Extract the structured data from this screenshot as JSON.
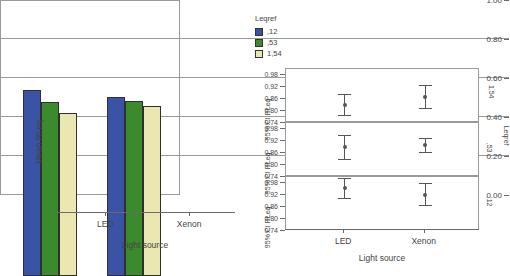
{
  "chart_data": [
    {
      "type": "bar",
      "title": "",
      "xlabel": "Light source",
      "ylabel": "Mean RLeq",
      "categories": [
        "LED",
        "Xenon"
      ],
      "ylim": [
        0.0,
        1.0
      ],
      "yticks": [
        "0.00",
        "0.20",
        "0.40",
        "0.60",
        "0.80",
        "1.00"
      ],
      "ytick_values": [
        0.0,
        0.2,
        0.4,
        0.6,
        0.8,
        1.0
      ],
      "grid": true,
      "legend_position": "right",
      "legend_title": "Leqref",
      "series": [
        {
          "name": ",12",
          "color": "#3A53A4",
          "values": [
            0.955,
            0.92
          ]
        },
        {
          "name": ",53",
          "color": "#3C8A2E",
          "values": [
            0.89,
            0.9
          ]
        },
        {
          "name": "1,54",
          "color": "#EAE8B0",
          "values": [
            0.835,
            0.87
          ]
        }
      ]
    },
    {
      "type": "scatter",
      "subtype": "error-bar-panels",
      "xlabel": "Light source",
      "ylabel": "95% CI RLeq",
      "categories": [
        "LED",
        "Xenon"
      ],
      "ylim": [
        0.74,
        1.01
      ],
      "yticks": [
        "0.74",
        "0.80",
        "0.86",
        "0.92",
        "0.98"
      ],
      "ytick_values": [
        0.74,
        0.8,
        0.86,
        0.92,
        0.98
      ],
      "grid": false,
      "strip_title": "Leqref",
      "panels": [
        {
          "strip_label": "1,54",
          "points": [
            {
              "x": "LED",
              "mean": 0.832,
              "lower": 0.782,
              "upper": 0.887
            },
            {
              "x": "Xenon",
              "mean": 0.872,
              "lower": 0.815,
              "upper": 0.928
            }
          ]
        },
        {
          "strip_label": ",53",
          "points": [
            {
              "x": "LED",
              "mean": 0.89,
              "lower": 0.83,
              "upper": 0.95
            },
            {
              "x": "Xenon",
              "mean": 0.902,
              "lower": 0.866,
              "upper": 0.936
            }
          ]
        },
        {
          "strip_label": ",12",
          "points": [
            {
              "x": "LED",
              "mean": 0.955,
              "lower": 0.906,
              "upper": 1.005
            },
            {
              "x": "Xenon",
              "mean": 0.921,
              "lower": 0.869,
              "upper": 0.978
            }
          ]
        }
      ]
    }
  ],
  "bar_chart": {
    "ylabel": "Mean RLeq",
    "xlabel": "Light source",
    "yticks": [
      "1.00",
      "0.80",
      "0.60",
      "0.40",
      "0.20",
      "0.00"
    ],
    "xticks": [
      "LED",
      "Xenon"
    ]
  },
  "legend": {
    "title": "Leqref",
    "items": [
      {
        "label": ",12",
        "color": "#3A53A4"
      },
      {
        "label": ",53",
        "color": "#3C8A2E"
      },
      {
        "label": "1,54",
        "color": "#EAE8B0"
      }
    ]
  },
  "ci_chart": {
    "xlabel": "Light source",
    "xticks": [
      "LED",
      "Xenon"
    ],
    "strip_title": "Leqref",
    "panels": [
      {
        "ylabel": "95% CI RLeq",
        "strip_label": "1,54",
        "yticks": [
          "0.98",
          "0.92",
          "0.86",
          "0.80",
          "0.74"
        ]
      },
      {
        "ylabel": "95% CI RLeq",
        "strip_label": ",53",
        "yticks": [
          "0.98",
          "0.92",
          "0.86",
          "0.80",
          "0.74"
        ]
      },
      {
        "ylabel": "95% CI RLeq",
        "strip_label": ",12",
        "yticks": [
          "0.98",
          "0.92",
          "0.86",
          "0.80",
          "0.74"
        ]
      }
    ]
  }
}
